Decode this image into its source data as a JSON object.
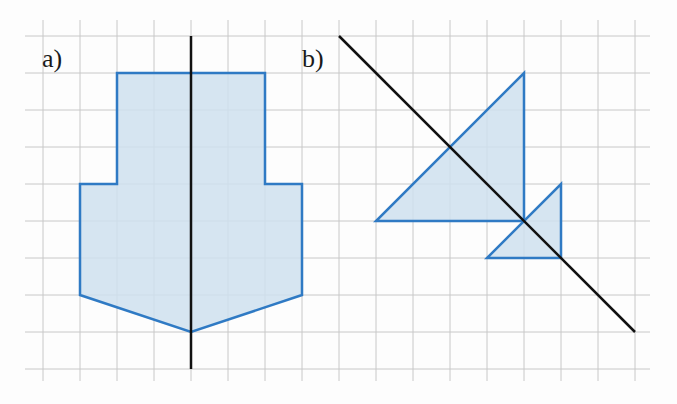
{
  "figure": {
    "labels": {
      "a": "a)",
      "b": "b)"
    },
    "colors": {
      "grid": "#c8c8c8",
      "shape_stroke": "#2f7ac4",
      "shape_fill": "#cfe0ee",
      "axis_line": "#111111"
    },
    "grid": {
      "cell_px": 37,
      "x0": 43,
      "y0": 36,
      "cols": 16,
      "rows": 9
    },
    "panel_a": {
      "description": "Symmetric pentagon-like shape with vertical axis of symmetry",
      "polygon_grid_points": [
        [
          2,
          1
        ],
        [
          6,
          1
        ],
        [
          6,
          4
        ],
        [
          7,
          4
        ],
        [
          7,
          7
        ],
        [
          4,
          8
        ],
        [
          1,
          7
        ],
        [
          1,
          4
        ],
        [
          2,
          4
        ]
      ],
      "axis_line": {
        "from": [
          4,
          0
        ],
        "to": [
          4,
          9
        ]
      }
    },
    "panel_b": {
      "description": "Two triangles reflected across a diagonal line",
      "triangle_large_grid_points": [
        [
          13,
          1
        ],
        [
          13,
          5
        ],
        [
          9,
          5
        ]
      ],
      "triangle_small_grid_points": [
        [
          14,
          4
        ],
        [
          14,
          6
        ],
        [
          12,
          6
        ]
      ],
      "axis_line": {
        "from": [
          8,
          0
        ],
        "to": [
          16,
          8
        ]
      }
    }
  }
}
